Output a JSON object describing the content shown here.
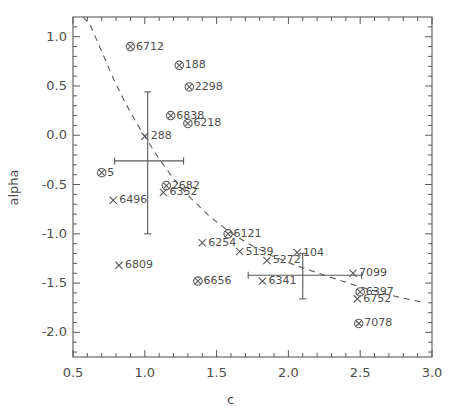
{
  "chart_data": {
    "type": "scatter",
    "title": "",
    "xlabel": "c",
    "ylabel": "alpha",
    "xlim": [
      0.5,
      3.0
    ],
    "ylim": [
      -2.25,
      1.2
    ],
    "grid": false,
    "legend": "none",
    "xticks": [
      "0.5",
      "1.0",
      "1.5",
      "2.0",
      "2.5",
      "3.0"
    ],
    "xtick_values": [
      0.5,
      1.0,
      1.5,
      2.0,
      2.5,
      3.0
    ],
    "yticks": [
      "1.0",
      "0.5",
      "0.0",
      "-0.5",
      "-1.0",
      "-1.5",
      "-2.0"
    ],
    "ytick_values": [
      1.0,
      0.5,
      0.0,
      -0.5,
      -1.0,
      -1.5,
      -2.0
    ],
    "x_minor_per_major": 5,
    "y_minor_per_major": 5,
    "marker_styles": {
      "circle_x": "circle with x inside (detection)",
      "x": "x only (upper limit)"
    },
    "series": [
      {
        "name": "circle-x markers",
        "marker": "circle_x",
        "points": [
          {
            "label": "6712",
            "c": 0.9,
            "alpha": 0.9
          },
          {
            "label": "188",
            "c": 1.24,
            "alpha": 0.71
          },
          {
            "label": "2298",
            "c": 1.31,
            "alpha": 0.49
          },
          {
            "label": "6838",
            "c": 1.18,
            "alpha": 0.2
          },
          {
            "label": "6218",
            "c": 1.3,
            "alpha": 0.12
          },
          {
            "label": "5",
            "c": 0.7,
            "alpha": -0.38
          },
          {
            "label": "2682",
            "c": 1.15,
            "alpha": -0.51
          },
          {
            "label": "6121",
            "c": 1.58,
            "alpha": -1.0
          },
          {
            "label": "6656",
            "c": 1.37,
            "alpha": -1.48
          },
          {
            "label": "6397",
            "c": 2.5,
            "alpha": -1.59
          },
          {
            "label": "7078",
            "c": 2.49,
            "alpha": -1.91
          }
        ]
      },
      {
        "name": "x markers",
        "marker": "x",
        "points": [
          {
            "label": "288",
            "c": 1.0,
            "alpha": -0.01
          },
          {
            "label": "6496",
            "c": 0.78,
            "alpha": -0.66
          },
          {
            "label": "6352",
            "c": 1.13,
            "alpha": -0.58
          },
          {
            "label": "6254",
            "c": 1.4,
            "alpha": -1.09
          },
          {
            "label": "5139",
            "c": 1.66,
            "alpha": -1.18
          },
          {
            "label": "5272",
            "c": 1.85,
            "alpha": -1.27
          },
          {
            "label": "104",
            "c": 2.06,
            "alpha": -1.19
          },
          {
            "label": "6809",
            "c": 0.82,
            "alpha": -1.32
          },
          {
            "label": "6341",
            "c": 1.82,
            "alpha": -1.48
          },
          {
            "label": "7099",
            "c": 2.45,
            "alpha": -1.4
          },
          {
            "label": "6752",
            "c": 2.48,
            "alpha": -1.66
          }
        ]
      }
    ],
    "errorbars": [
      {
        "c": 1.02,
        "alpha": -0.26,
        "xerr_low": 0.23,
        "xerr_high": 0.25,
        "yerr_low": 0.74,
        "yerr_high": 0.7
      },
      {
        "c": 2.1,
        "alpha": -1.42,
        "xerr_low": 0.38,
        "xerr_high": 0.41,
        "yerr_low": 0.24,
        "yerr_high": 0.22
      }
    ],
    "curve": {
      "style": "dashed",
      "description": "dashed model curve descending from upper-left to lower-right",
      "points": [
        {
          "c": 0.57,
          "alpha": 1.2
        },
        {
          "c": 0.62,
          "alpha": 1.12
        },
        {
          "c": 0.7,
          "alpha": 0.85
        },
        {
          "c": 0.78,
          "alpha": 0.58
        },
        {
          "c": 0.86,
          "alpha": 0.34
        },
        {
          "c": 0.94,
          "alpha": 0.13
        },
        {
          "c": 1.02,
          "alpha": -0.06
        },
        {
          "c": 1.1,
          "alpha": -0.24
        },
        {
          "c": 1.2,
          "alpha": -0.44
        },
        {
          "c": 1.32,
          "alpha": -0.64
        },
        {
          "c": 1.45,
          "alpha": -0.82
        },
        {
          "c": 1.58,
          "alpha": -0.97
        },
        {
          "c": 1.72,
          "alpha": -1.1
        },
        {
          "c": 1.88,
          "alpha": -1.22
        },
        {
          "c": 2.05,
          "alpha": -1.32
        },
        {
          "c": 2.25,
          "alpha": -1.42
        },
        {
          "c": 2.48,
          "alpha": -1.53
        },
        {
          "c": 2.7,
          "alpha": -1.62
        },
        {
          "c": 2.92,
          "alpha": -1.69
        }
      ]
    }
  },
  "axes": {
    "xlabel": "c",
    "ylabel": "alpha"
  }
}
